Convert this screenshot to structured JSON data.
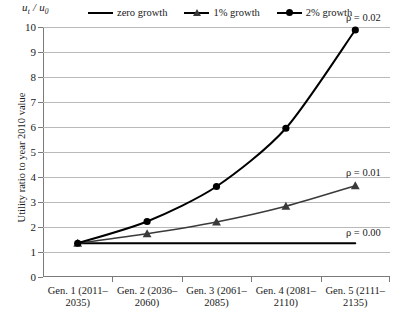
{
  "chart_data": {
    "type": "line",
    "title": "",
    "ylabel": "Utility ratio to year 2010 value",
    "y_unit_caption": "u",
    "y_unit_sub1": "t",
    "y_unit_div": " / u",
    "y_unit_sub2": "0",
    "xlabel": "",
    "ylim": [
      0,
      10
    ],
    "yticks": [
      "0",
      "1",
      "2",
      "3",
      "4",
      "5",
      "6",
      "7",
      "8",
      "9",
      "10"
    ],
    "grid": true,
    "legend_position": "top",
    "categories": [
      {
        "line1": "Gen. 1 (2011–",
        "line2": "2035)"
      },
      {
        "line1": "Gen. 2 (2036–",
        "line2": "2060)"
      },
      {
        "line1": "Gen. 3 (2061–",
        "line2": "2085)"
      },
      {
        "line1": "Gen. 4 (2081–",
        "line2": "2110)"
      },
      {
        "line1": "Gen. 5 (2111–",
        "line2": "2135)"
      }
    ],
    "series": [
      {
        "name": "zero growth",
        "marker": "none",
        "color": "#000000",
        "values": [
          1.35,
          1.35,
          1.35,
          1.35,
          1.35
        ],
        "annotation": "ρ = 0.00"
      },
      {
        "name": "1% growth",
        "marker": "triangle",
        "color": "#3a3a3a",
        "values": [
          1.35,
          1.73,
          2.2,
          2.83,
          3.65
        ],
        "annotation": "ρ = 0.01"
      },
      {
        "name": "2% growth",
        "marker": "circle",
        "color": "#000000",
        "values": [
          1.35,
          2.22,
          3.62,
          5.95,
          9.88
        ],
        "annotation": "ρ = 0.02"
      }
    ],
    "annotations": [
      {
        "text": "ρ = 0.02",
        "series": "2% growth"
      },
      {
        "text": "ρ = 0.01",
        "series": "1% growth"
      },
      {
        "text": "ρ = 0.00",
        "series": "zero growth"
      }
    ]
  }
}
